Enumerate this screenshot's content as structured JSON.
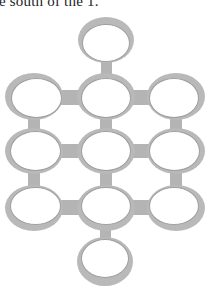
{
  "caption": "e south of the 1.",
  "diagram": {
    "colors": {
      "ring": "#b9b9b9",
      "connector": "#b4b4b4",
      "background": "#ffffff"
    },
    "rings": [
      {
        "id": "top",
        "x": 78,
        "y": 17,
        "w": 56,
        "h": 46,
        "hole": {
          "x": 4,
          "y": 7,
          "w": 48,
          "h": 38
        }
      },
      {
        "id": "r1c1",
        "x": 5,
        "y": 73,
        "w": 58,
        "h": 47,
        "hole": {
          "x": 6,
          "y": 5,
          "w": 51,
          "h": 40
        }
      },
      {
        "id": "r1c2",
        "x": 77,
        "y": 73,
        "w": 58,
        "h": 47,
        "hole": {
          "x": 4,
          "y": 5,
          "w": 50,
          "h": 40
        }
      },
      {
        "id": "r1c3",
        "x": 147,
        "y": 73,
        "w": 58,
        "h": 47,
        "hole": {
          "x": 2,
          "y": 5,
          "w": 50,
          "h": 40
        }
      },
      {
        "id": "r2c1",
        "x": 5,
        "y": 128,
        "w": 58,
        "h": 46,
        "hole": {
          "x": 5,
          "y": 3,
          "w": 51,
          "h": 40
        }
      },
      {
        "id": "r2c2",
        "x": 77,
        "y": 128,
        "w": 58,
        "h": 46,
        "hole": {
          "x": 4,
          "y": 3,
          "w": 50,
          "h": 40
        }
      },
      {
        "id": "r2c3",
        "x": 147,
        "y": 128,
        "w": 58,
        "h": 46,
        "hole": {
          "x": 2,
          "y": 3,
          "w": 51,
          "h": 40
        }
      },
      {
        "id": "r3c1",
        "x": 5,
        "y": 185,
        "w": 58,
        "h": 46,
        "hole": {
          "x": 5,
          "y": 2,
          "w": 51,
          "h": 38
        }
      },
      {
        "id": "r3c2",
        "x": 77,
        "y": 185,
        "w": 58,
        "h": 46,
        "hole": {
          "x": 4,
          "y": 2,
          "w": 50,
          "h": 38
        }
      },
      {
        "id": "r3c3",
        "x": 147,
        "y": 185,
        "w": 58,
        "h": 46,
        "hole": {
          "x": 2,
          "y": 2,
          "w": 50,
          "h": 38
        }
      },
      {
        "id": "bottom",
        "x": 77,
        "y": 237,
        "w": 56,
        "h": 49,
        "hole": {
          "x": 4,
          "y": 2,
          "w": 48,
          "h": 39
        }
      }
    ],
    "connectors": [
      {
        "x": 101,
        "y": 61,
        "w": 11,
        "h": 14
      },
      {
        "x": 60,
        "y": 90,
        "w": 19,
        "h": 15
      },
      {
        "x": 132,
        "y": 90,
        "w": 17,
        "h": 15
      },
      {
        "x": 28,
        "y": 118,
        "w": 12,
        "h": 12
      },
      {
        "x": 100,
        "y": 118,
        "w": 12,
        "h": 12
      },
      {
        "x": 170,
        "y": 118,
        "w": 12,
        "h": 12
      },
      {
        "x": 60,
        "y": 144,
        "w": 19,
        "h": 14
      },
      {
        "x": 132,
        "y": 144,
        "w": 17,
        "h": 14
      },
      {
        "x": 28,
        "y": 172,
        "w": 12,
        "h": 15
      },
      {
        "x": 100,
        "y": 172,
        "w": 12,
        "h": 15
      },
      {
        "x": 170,
        "y": 172,
        "w": 12,
        "h": 15
      },
      {
        "x": 60,
        "y": 200,
        "w": 19,
        "h": 15
      },
      {
        "x": 132,
        "y": 200,
        "w": 17,
        "h": 15
      },
      {
        "x": 100,
        "y": 229,
        "w": 11,
        "h": 10
      }
    ]
  }
}
